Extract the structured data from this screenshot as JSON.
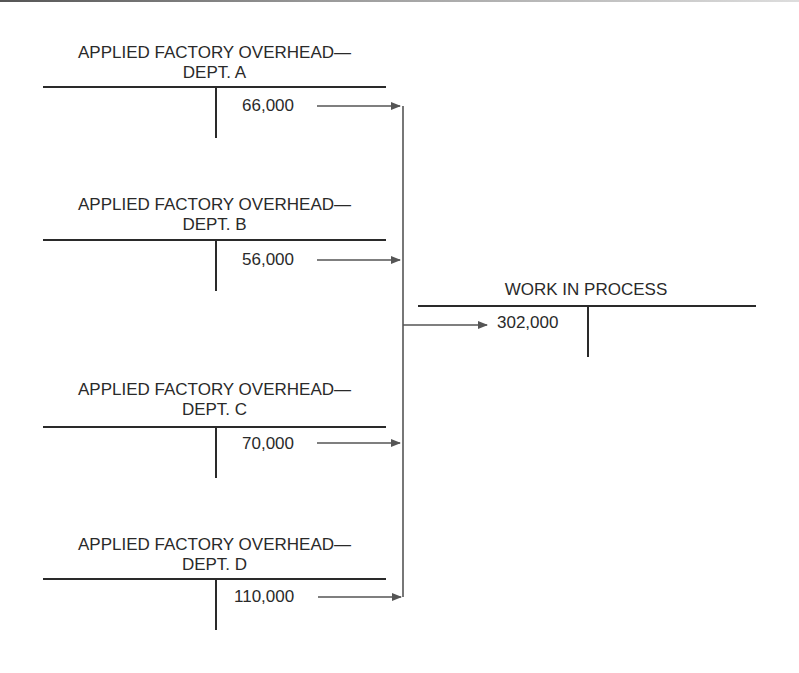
{
  "diagram": {
    "accounts": [
      {
        "title_line1": "APPLIED FACTORY OVERHEAD—",
        "title_line2": "DEPT. A",
        "credit": "66,000"
      },
      {
        "title_line1": "APPLIED FACTORY OVERHEAD—",
        "title_line2": "DEPT. B",
        "credit": "56,000"
      },
      {
        "title_line1": "APPLIED FACTORY OVERHEAD—",
        "title_line2": "DEPT. C",
        "credit": "70,000"
      },
      {
        "title_line1": "APPLIED FACTORY OVERHEAD—",
        "title_line2": "DEPT. D",
        "credit": "110,000"
      }
    ],
    "target": {
      "title": "WORK IN PROCESS",
      "debit": "302,000"
    },
    "colors": {
      "line": "#2a2a2a",
      "arrow": "#555555"
    }
  }
}
